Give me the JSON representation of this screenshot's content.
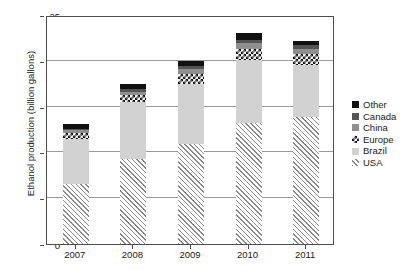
{
  "chart_data": {
    "type": "bar",
    "stacked": true,
    "title": "",
    "xlabel": "",
    "ylabel": "Ethanol production (billion gallons)",
    "categories": [
      "2007",
      "2008",
      "2009",
      "2010",
      "2011"
    ],
    "ylim": [
      0,
      25
    ],
    "yticks": [
      0,
      5,
      10,
      15,
      20,
      25
    ],
    "grid": true,
    "legend_position": "right",
    "series": [
      {
        "name": "USA",
        "color": "#ffffff",
        "pattern": "diagonal-hatch",
        "values": [
          6.5,
          9.3,
          10.9,
          13.2,
          13.9
        ]
      },
      {
        "name": "Brazil",
        "color": "#d2d2d2",
        "pattern": "solid",
        "values": [
          5.0,
          6.2,
          6.6,
          6.9,
          5.6
        ]
      },
      {
        "name": "Europe",
        "color": "#141414",
        "pattern": "checkerboard",
        "values": [
          0.6,
          0.8,
          1.1,
          1.2,
          1.2
        ]
      },
      {
        "name": "China",
        "color": "#8f8f8f",
        "pattern": "solid",
        "values": [
          0.3,
          0.3,
          0.5,
          0.6,
          0.6
        ]
      },
      {
        "name": "Canada",
        "color": "#555555",
        "pattern": "solid",
        "values": [
          0.2,
          0.3,
          0.3,
          0.4,
          0.4
        ]
      },
      {
        "name": "Other",
        "color": "#111111",
        "pattern": "solid",
        "values": [
          0.5,
          0.6,
          0.6,
          0.7,
          0.5
        ]
      }
    ],
    "totals": [
      13.1,
      17.5,
      20.0,
      23.0,
      22.2
    ]
  },
  "axes": {
    "y_title": "Ethanol production (billion gallons)",
    "y_ticks": [
      "25",
      "20",
      "15",
      "10",
      "5",
      "0"
    ],
    "x_ticks": [
      "2007",
      "2008",
      "2009",
      "2010",
      "2011"
    ]
  },
  "legend": {
    "items": [
      {
        "label": "Other"
      },
      {
        "label": "Canada"
      },
      {
        "label": "China"
      },
      {
        "label": "Europe"
      },
      {
        "label": "Brazil"
      },
      {
        "label": "USA"
      }
    ]
  }
}
